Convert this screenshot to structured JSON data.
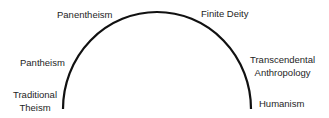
{
  "diagram": {
    "type": "semicircular-spectrum",
    "line_color": "#111111",
    "text_color": "#1e1e1e",
    "labels": {
      "panentheism": "Panentheism",
      "finite_deity": "Finite Deity",
      "pantheism": "Pantheism",
      "traditional_theism_line1": "Traditional",
      "traditional_theism_line2": "Theism",
      "transcendental_line1": "Transcendental",
      "transcendental_line2": "Anthropology",
      "humanism": "Humanism"
    }
  }
}
